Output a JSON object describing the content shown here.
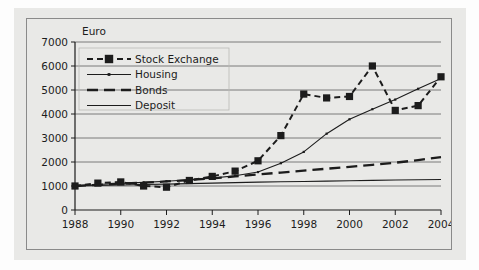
{
  "figure": {
    "unit_label": "Euro",
    "background_color": "#e9e9e7",
    "page_color": "#fdfdfd",
    "frame_color": "#8a8a8a",
    "ink_color": "#1c1c1c",
    "gridline_color": "#6e6e6e"
  },
  "chart_data": {
    "type": "line",
    "title": "",
    "subtitle": "",
    "xlabel": "",
    "ylabel": "Euro",
    "ylim": [
      0,
      7000
    ],
    "xlim": [
      1988,
      2004
    ],
    "grid": true,
    "legend_position": "top-left inside plot area",
    "ytick_labels": [
      "0",
      "1000",
      "2000",
      "3000",
      "4000",
      "5000",
      "6000",
      "7000"
    ],
    "yticks": [
      0,
      1000,
      2000,
      3000,
      4000,
      5000,
      6000,
      7000
    ],
    "xtick_labels": [
      "1988",
      "1990",
      "1992",
      "1994",
      "1996",
      "1998",
      "2000",
      "2002",
      "2004"
    ],
    "xticks": [
      1988,
      1990,
      1992,
      1994,
      1996,
      1998,
      2000,
      2002,
      2004
    ],
    "x": [
      1988,
      1989,
      1990,
      1991,
      1992,
      1993,
      1994,
      1995,
      1996,
      1997,
      1998,
      1999,
      2000,
      2001,
      2002,
      2003,
      2004
    ],
    "series": [
      {
        "name": "Stock Exchange",
        "style": "dashed-with-square-markers",
        "color": "#1c1c1c",
        "values": [
          1000,
          1120,
          1170,
          1000,
          950,
          1230,
          1400,
          1620,
          2050,
          3100,
          4830,
          4670,
          4730,
          6000,
          4150,
          4350,
          5550
        ]
      },
      {
        "name": "Housing",
        "style": "thin-solid-with-small-markers",
        "color": "#1c1c1c",
        "values": [
          1000,
          1060,
          1110,
          1150,
          1200,
          1260,
          1330,
          1430,
          1580,
          1950,
          2420,
          3180,
          3780,
          4200,
          4600,
          5050,
          5480
        ]
      },
      {
        "name": "Bonds",
        "style": "long-dashed",
        "color": "#1c1c1c",
        "values": [
          1000,
          1050,
          1100,
          1140,
          1190,
          1250,
          1320,
          1400,
          1480,
          1560,
          1640,
          1720,
          1800,
          1880,
          1970,
          2080,
          2200
        ]
      },
      {
        "name": "Deposit",
        "style": "thin-solid",
        "color": "#1c1c1c",
        "values": [
          1000,
          1020,
          1040,
          1060,
          1080,
          1100,
          1120,
          1140,
          1160,
          1175,
          1190,
          1205,
          1220,
          1235,
          1248,
          1260,
          1270
        ]
      }
    ]
  },
  "legend": {
    "items": [
      {
        "label": "Stock Exchange"
      },
      {
        "label": "Housing"
      },
      {
        "label": "Bonds"
      },
      {
        "label": "Deposit"
      }
    ]
  }
}
